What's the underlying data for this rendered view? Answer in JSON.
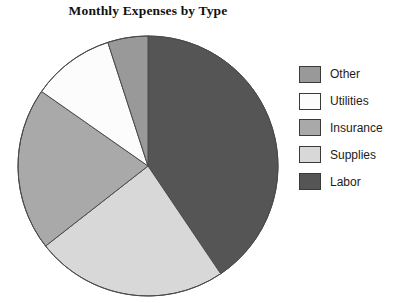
{
  "chart_data": {
    "type": "pie",
    "title": "Monthly Expenses by Type",
    "xlabel": "",
    "ylabel": "",
    "legend_position": "right",
    "grid": false,
    "start_angle_deg": 0,
    "direction": "clockwise",
    "categories": [
      "Labor",
      "Supplies",
      "Insurance",
      "Utilities",
      "Other"
    ],
    "values": [
      40.5,
      24.0,
      20.3,
      10.2,
      5.0
    ],
    "slices": [
      {
        "label": "Labor",
        "percent": 40.5,
        "angle_deg": 146,
        "color": "#555555"
      },
      {
        "label": "Supplies",
        "percent": 24.0,
        "angle_deg": 86,
        "color": "#d8d8d8"
      },
      {
        "label": "Insurance",
        "percent": 20.3,
        "angle_deg": 73,
        "color": "#a9a9a9"
      },
      {
        "label": "Utilities",
        "percent": 10.2,
        "angle_deg": 37,
        "color": "#fcfcfc"
      },
      {
        "label": "Other",
        "percent": 5.0,
        "angle_deg": 18,
        "color": "#999999"
      }
    ],
    "legend_entries": [
      {
        "label": "Other",
        "color": "#999999"
      },
      {
        "label": "Utilities",
        "color": "#fcfcfc"
      },
      {
        "label": "Insurance",
        "color": "#a9a9a9"
      },
      {
        "label": "Supplies",
        "color": "#d8d8d8"
      },
      {
        "label": "Labor",
        "color": "#555555"
      }
    ],
    "geometry": {
      "center_x": 148,
      "center_y": 166,
      "radius": 130,
      "outline_color": "#4a4a4a"
    }
  }
}
